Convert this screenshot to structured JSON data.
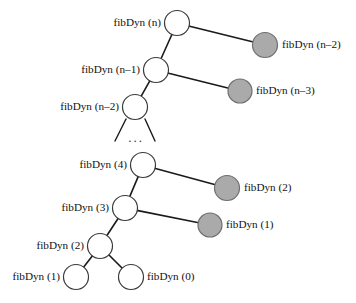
{
  "figure": {
    "kind": "recursion-tree-diagram",
    "colors": {
      "background": "#ffffff",
      "node_open_fill": "#ffffff",
      "node_open_stroke": "#3a3a3a",
      "node_memo_fill": "#aaaaaa",
      "node_memo_stroke": "#6f6f6f",
      "edge": "#1a1a1a",
      "text": "#111111"
    },
    "ellipsis_vertical": "...",
    "ellipsis_horizontal": "..."
  },
  "upper_tree": {
    "nodes": [
      {
        "id": "u0",
        "label": "fibDyn (n)",
        "cx": 177,
        "cy": 23,
        "r": 12.5,
        "style": "open",
        "label_side": "left",
        "label_x": 161,
        "label_y": 23
      },
      {
        "id": "u1",
        "label": "fibDyn (n–2)",
        "cx": 265,
        "cy": 45,
        "r": 12.5,
        "style": "filled",
        "label_side": "right",
        "label_x": 282,
        "label_y": 45
      },
      {
        "id": "u2",
        "label": "fibDyn (n–1)",
        "cx": 156,
        "cy": 70,
        "r": 12.5,
        "style": "open",
        "label_side": "left",
        "label_x": 140,
        "label_y": 70
      },
      {
        "id": "u3",
        "label": "fibDyn (n–3)",
        "cx": 240,
        "cy": 91,
        "r": 12.0,
        "style": "filled",
        "label_side": "right",
        "label_x": 256,
        "label_y": 91
      },
      {
        "id": "u4",
        "label": "fibDyn (n–2)",
        "cx": 135,
        "cy": 107,
        "r": 12.5,
        "style": "open",
        "label_side": "left",
        "label_x": 119,
        "label_y": 107
      }
    ],
    "edges": [
      {
        "from": "u0",
        "to": "u1"
      },
      {
        "from": "u0",
        "to": "u2"
      },
      {
        "from": "u2",
        "to": "u3"
      },
      {
        "from": "u2",
        "to": "u4"
      }
    ]
  },
  "lower_tree": {
    "nodes": [
      {
        "id": "l0",
        "label": "fibDyn (4)",
        "cx": 143,
        "cy": 165,
        "r": 12.5,
        "style": "open",
        "label_side": "left",
        "label_x": 127,
        "label_y": 165
      },
      {
        "id": "l1",
        "label": "fibDyn (2)",
        "cx": 227,
        "cy": 188,
        "r": 12.5,
        "style": "filled",
        "label_side": "right",
        "label_x": 244,
        "label_y": 188
      },
      {
        "id": "l2",
        "label": "fibDyn (3)",
        "cx": 125,
        "cy": 208,
        "r": 12.5,
        "style": "open",
        "label_side": "left",
        "label_x": 109,
        "label_y": 208
      },
      {
        "id": "l3",
        "label": "fibDyn (1)",
        "cx": 210,
        "cy": 225,
        "r": 12.0,
        "style": "filled",
        "label_side": "right",
        "label_x": 226,
        "label_y": 225
      },
      {
        "id": "l4",
        "label": "fibDyn (2)",
        "cx": 100,
        "cy": 246,
        "r": 12.5,
        "style": "open",
        "label_side": "left",
        "label_x": 84,
        "label_y": 246
      },
      {
        "id": "l5",
        "label": "fibDyn (1)",
        "cx": 76,
        "cy": 277,
        "r": 12.5,
        "style": "open",
        "label_side": "left",
        "label_x": 60,
        "label_y": 277
      },
      {
        "id": "l6",
        "label": "fibDyn (0)",
        "cx": 131,
        "cy": 277,
        "r": 12.5,
        "style": "open",
        "label_side": "right",
        "label_x": 147,
        "label_y": 277
      }
    ],
    "edges": [
      {
        "from": "l0",
        "to": "l1"
      },
      {
        "from": "l0",
        "to": "l2"
      },
      {
        "from": "l2",
        "to": "l3"
      },
      {
        "from": "l2",
        "to": "l4"
      },
      {
        "from": "l4",
        "to": "l5"
      },
      {
        "from": "l4",
        "to": "l6"
      }
    ]
  },
  "continuation": {
    "stub_left": {
      "x1": 126,
      "y1": 119,
      "x2": 115,
      "y2": 141
    },
    "stub_right": {
      "x1": 145,
      "y1": 119,
      "x2": 155,
      "y2": 141
    },
    "dots": {
      "text": "...",
      "x": 136,
      "y": 142
    }
  }
}
